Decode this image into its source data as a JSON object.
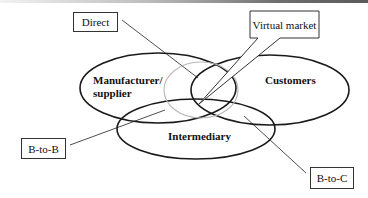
{
  "diagram": {
    "type": "venn",
    "sets": [
      {
        "id": "manufacturer",
        "label": "Manufacturer/\nsupplier",
        "label_line1": "Manufacturer/",
        "label_line2": "supplier"
      },
      {
        "id": "customers",
        "label": "Customers"
      },
      {
        "id": "intermediary",
        "label": "Intermediary"
      }
    ],
    "center_region": "Virtual market",
    "callouts": [
      {
        "id": "direct",
        "label": "Direct",
        "points_to": "manufacturer ∩ customers"
      },
      {
        "id": "virtual-market",
        "label": "Virtual market",
        "points_to": "manufacturer ∩ customers ∩ intermediary"
      },
      {
        "id": "b-to-b",
        "label": "B-to-B",
        "points_to": "manufacturer ∩ intermediary"
      },
      {
        "id": "b-to-c",
        "label": "B-to-C",
        "points_to": "customers ∩ intermediary"
      }
    ]
  },
  "colors": {
    "stroke": "#1a1a1a",
    "center_ellipse": "#b8b8b8"
  }
}
